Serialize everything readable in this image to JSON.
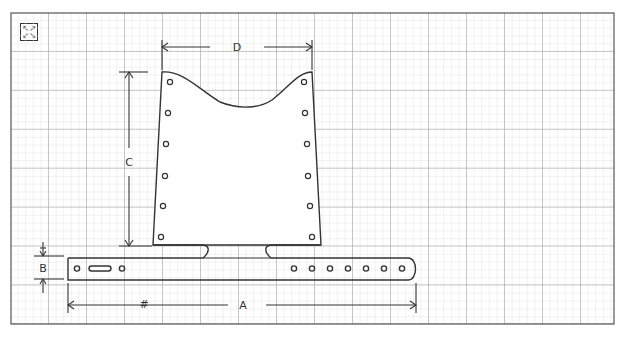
{
  "controls": {
    "expand_icon_glyphs": [
      "↖",
      "↗",
      "↙",
      "↘"
    ]
  },
  "diagram": {
    "type": "technical-dimension-drawing",
    "background": "grid paper",
    "colors": {
      "line": "#333333",
      "grid_major": "#9a9a9a",
      "grid_minor": "#e2e2e2",
      "frame": "#555555"
    },
    "dimension_labels": {
      "A": "A",
      "B": "B",
      "C": "C",
      "D": "D",
      "hash": "#"
    },
    "parts": {
      "upright": {
        "holes_per_side": 6
      },
      "base_bar": {
        "slot_count": 1,
        "left_holes": 2,
        "right_holes": 7
      }
    }
  }
}
